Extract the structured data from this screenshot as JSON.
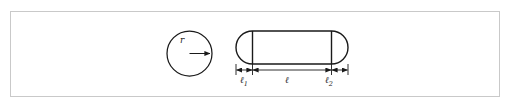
{
  "figure": {
    "background_color": "#ffffff",
    "frame_color": "#c9c9c9",
    "stroke_color": "#1a1a1a",
    "shapes": {
      "circle": {
        "name": "circle",
        "center_x": 189.5,
        "center_y": 53.5,
        "radius": 22.5,
        "radius_label": "r",
        "radius_arrow": {
          "from_x": 189.5,
          "from_y": 53.5,
          "to_x": 211,
          "to_y": 53.5
        }
      },
      "capsule": {
        "name": "capsule",
        "left_x": 236,
        "right_x": 348,
        "top_y": 31,
        "bottom_y": 64,
        "cap_radius": 16.5,
        "left_divider_x": 252.5,
        "right_divider_x": 331.5
      }
    },
    "dimension_line": {
      "y": 70,
      "tick_top": 65,
      "tick_bottom": 75,
      "ticks_x": [
        236,
        252.5,
        331.5,
        348
      ],
      "segments": [
        {
          "name": "l1",
          "label": "ℓ",
          "subscript": "1",
          "from_x": 236,
          "to_x": 252.5
        },
        {
          "name": "l",
          "label": "ℓ",
          "subscript": "",
          "from_x": 252.5,
          "to_x": 331.5
        },
        {
          "name": "l2",
          "label": "ℓ",
          "subscript": "2",
          "from_x": 331.5,
          "to_x": 348
        }
      ]
    },
    "labels": {
      "radius": "r",
      "l1_base": "ℓ",
      "l1_sub": "1",
      "l_base": "ℓ",
      "l2_base": "ℓ",
      "l2_sub": "2"
    }
  }
}
